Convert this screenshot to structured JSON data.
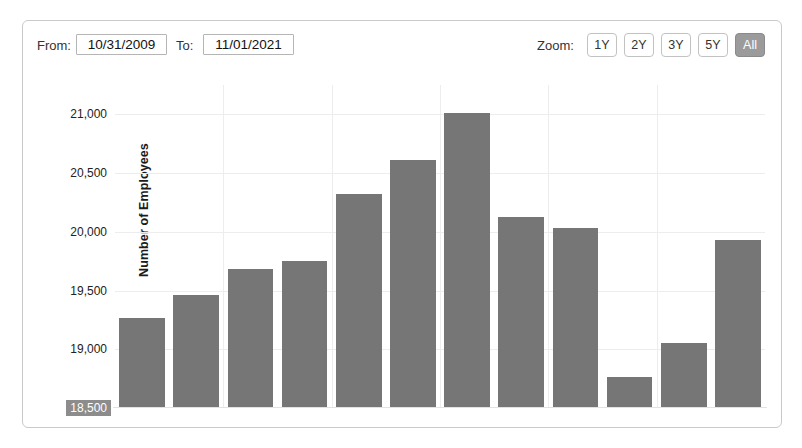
{
  "toolbar": {
    "from_label": "From:",
    "from_value": "10/31/2009",
    "to_label": "To:",
    "to_value": "11/01/2021",
    "zoom_label": "Zoom:",
    "zoom_buttons": [
      {
        "label": "1Y",
        "active": false
      },
      {
        "label": "2Y",
        "active": false
      },
      {
        "label": "3Y",
        "active": false
      },
      {
        "label": "5Y",
        "active": false
      },
      {
        "label": "All",
        "active": true
      }
    ]
  },
  "colors": {
    "bar": "#767676",
    "grid": "#ededed",
    "active_button": "#9b9b9b",
    "border": "#c9c9c9",
    "highlight": "#8c8c8c"
  },
  "chart_data": {
    "type": "bar",
    "title": "",
    "xlabel": "",
    "ylabel": "Number of Employees",
    "ylim": [
      18500,
      21250
    ],
    "yticks": [
      18500,
      19000,
      19500,
      20000,
      20500,
      21000
    ],
    "ytick_labels": [
      "18,500",
      "19,000",
      "19,500",
      "20,000",
      "20,500",
      "21,000"
    ],
    "highlighted_ytick": "18,500",
    "grid": true,
    "legend": false,
    "categories": [
      "1",
      "2",
      "3",
      "4",
      "5",
      "6",
      "7",
      "8",
      "9",
      "10",
      "11",
      "12"
    ],
    "values": [
      19270,
      19465,
      19685,
      19750,
      20325,
      20610,
      21010,
      20125,
      20030,
      18765,
      19050,
      19930
    ]
  }
}
